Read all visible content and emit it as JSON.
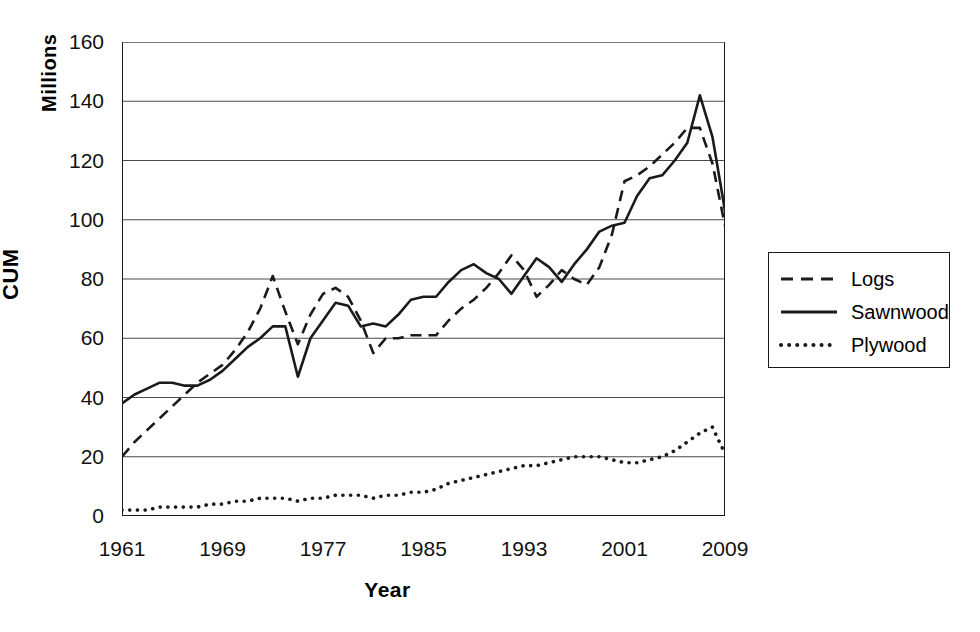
{
  "chart_data": {
    "type": "line",
    "title": "",
    "xlabel": "Year",
    "ylabel": "CUM",
    "yunit": "Millions",
    "xlim": [
      1961,
      2009
    ],
    "ylim": [
      0,
      160
    ],
    "ytick_step": 20,
    "xtick_step": 8,
    "grid": "horizontal",
    "legend_position": "right",
    "yticks": [
      "0",
      "20",
      "40",
      "60",
      "80",
      "100",
      "120",
      "140",
      "160"
    ],
    "xticks": [
      "1961",
      "1969",
      "1977",
      "1985",
      "1993",
      "2001",
      "2009"
    ],
    "x": [
      1961,
      1962,
      1963,
      1964,
      1965,
      1966,
      1967,
      1968,
      1969,
      1970,
      1971,
      1972,
      1973,
      1974,
      1975,
      1976,
      1977,
      1978,
      1979,
      1980,
      1981,
      1982,
      1983,
      1984,
      1985,
      1986,
      1987,
      1988,
      1989,
      1990,
      1991,
      1992,
      1993,
      1994,
      1995,
      1996,
      1997,
      1998,
      1999,
      2000,
      2001,
      2002,
      2003,
      2004,
      2005,
      2006,
      2007,
      2008,
      2009
    ],
    "series": [
      {
        "name": "Logs",
        "style": "dashed",
        "color": "#1a1a1a",
        "values": [
          20,
          25,
          29,
          33,
          37,
          41,
          45,
          48,
          51,
          56,
          62,
          70,
          81,
          69,
          58,
          68,
          75,
          77,
          74,
          66,
          55,
          60,
          60,
          61,
          61,
          61,
          66,
          70,
          73,
          77,
          82,
          88,
          83,
          74,
          78,
          83,
          80,
          78,
          84,
          95,
          113,
          115,
          118,
          122,
          126,
          131,
          131,
          119,
          98
        ]
      },
      {
        "name": "Sawnwood",
        "style": "solid",
        "color": "#1a1a1a",
        "values": [
          38,
          41,
          43,
          45,
          45,
          44,
          44,
          46,
          49,
          53,
          57,
          60,
          64,
          64,
          47,
          60,
          66,
          72,
          71,
          64,
          65,
          64,
          68,
          73,
          74,
          74,
          79,
          83,
          85,
          82,
          80,
          75,
          81,
          87,
          84,
          79,
          85,
          90,
          96,
          98,
          99,
          108,
          114,
          115,
          120,
          126,
          142,
          128,
          103
        ]
      },
      {
        "name": "Plywood",
        "style": "dotted",
        "color": "#1a1a1a",
        "values": [
          2,
          2,
          2,
          3,
          3,
          3,
          3,
          4,
          4,
          5,
          5,
          6,
          6,
          6,
          5,
          6,
          6,
          7,
          7,
          7,
          6,
          7,
          7,
          8,
          8,
          9,
          11,
          12,
          13,
          14,
          15,
          16,
          17,
          17,
          18,
          19,
          20,
          20,
          20,
          19,
          18,
          18,
          19,
          20,
          22,
          25,
          28,
          30,
          21
        ]
      }
    ]
  },
  "legend": {
    "items": [
      {
        "label": "Logs",
        "style": "dashed"
      },
      {
        "label": "Sawnwood",
        "style": "solid"
      },
      {
        "label": "Plywood",
        "style": "dotted"
      }
    ]
  }
}
